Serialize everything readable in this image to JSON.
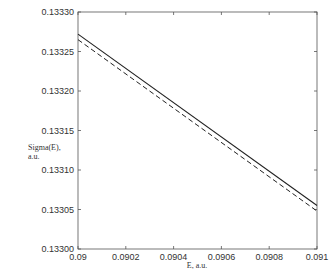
{
  "chart_data": {
    "type": "line",
    "title": "",
    "xlabel": "E, a.u.",
    "ylabel": "Sigma(E), a.u.",
    "ylabel_lines": [
      "Sigma(E),",
      "a.u."
    ],
    "xlim": [
      0.09,
      0.091
    ],
    "ylim": [
      0.133,
      0.1333
    ],
    "x_ticks": [
      "0.09",
      "0.0902",
      "0.0904",
      "0.0906",
      "0.0908",
      "0.091"
    ],
    "y_ticks": [
      "0.13330",
      "0.13325",
      "0.13320",
      "0.13315",
      "0.13310",
      "0.13305",
      "0.13300"
    ],
    "grid": false,
    "legend": null,
    "series": [
      {
        "name": "solid",
        "style": "solid",
        "x": [
          0.09,
          0.091
        ],
        "y": [
          0.133272,
          0.133055
        ]
      },
      {
        "name": "dashed",
        "style": "dashed",
        "x": [
          0.09,
          0.091
        ],
        "y": [
          0.133265,
          0.133048
        ]
      }
    ]
  }
}
